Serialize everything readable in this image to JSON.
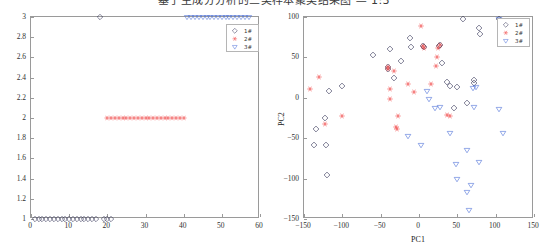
{
  "figure_title": "基于主成分分析的三类样本聚类结果图 — 1:3",
  "colors": {
    "class1": "#2b2b4f",
    "class2": "#f04a4a",
    "class3": "#4a6fd8",
    "axis": "#9a9a9a",
    "text": "#303030"
  },
  "legend": {
    "entries": [
      {
        "label": "1#",
        "marker": "diamond",
        "color": "#2b2b4f"
      },
      {
        "label": "2#",
        "marker": "asterisk",
        "color": "#f04a4a"
      },
      {
        "label": "3#",
        "marker": "triangle-down",
        "color": "#4a6fd8"
      }
    ]
  },
  "chart_data": [
    {
      "id": "cluster-assignment-plot",
      "type": "scatter",
      "title": "",
      "xlabel": "",
      "ylabel": "",
      "xlim": [
        0,
        60
      ],
      "ylim": [
        1,
        3
      ],
      "xticks": [
        0,
        10,
        20,
        30,
        40,
        50,
        60
      ],
      "yticks": [
        1,
        1.2,
        1.4,
        1.6,
        1.8,
        2,
        2.2,
        2.4,
        2.6,
        2.8,
        3
      ],
      "xticklabels": [
        "0",
        "10",
        "20",
        "30",
        "40",
        "50",
        "60"
      ],
      "yticklabels": [
        "1",
        "1.2",
        "1.4",
        "1.6",
        "1.8",
        "2",
        "2.2",
        "2.4",
        "2.6",
        "2.8",
        "3"
      ],
      "grid": false,
      "legend_position": "top-right-inside",
      "series": [
        {
          "name": "1#",
          "marker": "diamond",
          "color": "#2b2b4f",
          "points": [
            [
              1,
              1
            ],
            [
              2,
              1
            ],
            [
              3,
              1
            ],
            [
              4,
              1
            ],
            [
              5,
              1
            ],
            [
              6,
              1
            ],
            [
              7,
              1
            ],
            [
              8,
              1
            ],
            [
              9,
              1
            ],
            [
              10,
              1
            ],
            [
              11,
              1
            ],
            [
              12,
              1
            ],
            [
              13,
              1
            ],
            [
              14,
              1
            ],
            [
              15,
              1
            ],
            [
              16,
              1
            ],
            [
              17,
              1
            ],
            [
              19,
              1
            ],
            [
              20,
              1
            ],
            [
              21,
              1
            ],
            [
              18,
              3
            ]
          ]
        },
        {
          "name": "2#",
          "marker": "asterisk",
          "color": "#f04a4a",
          "points": [
            [
              20,
              2
            ],
            [
              21,
              2
            ],
            [
              22,
              2
            ],
            [
              23,
              2
            ],
            [
              24,
              2
            ],
            [
              25,
              2
            ],
            [
              26,
              2
            ],
            [
              27,
              2
            ],
            [
              28,
              2
            ],
            [
              29,
              2
            ],
            [
              30,
              2
            ],
            [
              31,
              2
            ],
            [
              32,
              2
            ],
            [
              33,
              2
            ],
            [
              34,
              2
            ],
            [
              35,
              2
            ],
            [
              36,
              2
            ],
            [
              37,
              2
            ],
            [
              38,
              2
            ],
            [
              39,
              2
            ],
            [
              40,
              2
            ]
          ]
        },
        {
          "name": "3#",
          "marker": "triangle-down",
          "color": "#4a6fd8",
          "points": [
            [
              41,
              3
            ],
            [
              42,
              3
            ],
            [
              43,
              3
            ],
            [
              44,
              3
            ],
            [
              45,
              3
            ],
            [
              46,
              3
            ],
            [
              47,
              3
            ],
            [
              48,
              3
            ],
            [
              49,
              3
            ],
            [
              50,
              3
            ],
            [
              51,
              3
            ],
            [
              52,
              3
            ],
            [
              53,
              3
            ],
            [
              54,
              3
            ],
            [
              55,
              3
            ],
            [
              56,
              3
            ],
            [
              57,
              3
            ]
          ]
        }
      ]
    },
    {
      "id": "pca-score-plot",
      "type": "scatter",
      "title": "",
      "xlabel": "PC1",
      "ylabel": "PC2",
      "xlim": [
        -150,
        150
      ],
      "ylim": [
        -150,
        100
      ],
      "xticks": [
        -150,
        -100,
        -50,
        0,
        50,
        100,
        150
      ],
      "yticks": [
        -150,
        -100,
        -50,
        0,
        50,
        100
      ],
      "xticklabels": [
        "−150",
        "−100",
        "−50",
        "0",
        "50",
        "100",
        "150"
      ],
      "yticklabels": [
        "−150",
        "−100",
        "−50",
        "0",
        "50",
        "100"
      ],
      "grid": false,
      "legend_position": "top-right-inside",
      "series": [
        {
          "name": "1#",
          "marker": "diamond",
          "color": "#2b2b4f",
          "points": [
            [
              -118,
              8
            ],
            [
              -101,
              14
            ],
            [
              -60,
              53
            ],
            [
              -38,
              60
            ],
            [
              -41,
              38
            ],
            [
              -40,
              36
            ],
            [
              -24,
              46
            ],
            [
              -32,
              24
            ],
            [
              -12,
              74
            ],
            [
              -11,
              63
            ],
            [
              5,
              64
            ],
            [
              7,
              63
            ],
            [
              26,
              64
            ],
            [
              28,
              65
            ],
            [
              30,
              43
            ],
            [
              37,
              19
            ],
            [
              41,
              15
            ],
            [
              50,
              13
            ],
            [
              58,
              97
            ],
            [
              72,
              22
            ],
            [
              72,
              18
            ],
            [
              78,
              86
            ],
            [
              80,
              79
            ],
            [
              104,
              97
            ],
            [
              -134,
              -38
            ],
            [
              -137,
              -59
            ],
            [
              -122,
              -25
            ],
            [
              -121,
              -58
            ],
            [
              -120,
              -96
            ],
            [
              46,
              -13
            ],
            [
              62,
              -6
            ]
          ]
        },
        {
          "name": "2#",
          "marker": "asterisk",
          "color": "#f04a4a",
          "points": [
            [
              -142,
              11
            ],
            [
              -131,
              26
            ],
            [
              -123,
              -32
            ],
            [
              -100,
              -22
            ],
            [
              -41,
              38
            ],
            [
              -40,
              36
            ],
            [
              -38,
              11
            ],
            [
              -38,
              -2
            ],
            [
              -33,
              33
            ],
            [
              -30,
              -36
            ],
            [
              -29,
              -38
            ],
            [
              -28,
              -22
            ],
            [
              -14,
              17
            ],
            [
              -6,
              7
            ],
            [
              3,
              89
            ],
            [
              5,
              64
            ],
            [
              6,
              62
            ],
            [
              16,
              17
            ],
            [
              22,
              39
            ],
            [
              24,
              50
            ],
            [
              25,
              62
            ],
            [
              28,
              65
            ],
            [
              37,
              -21
            ],
            [
              40,
              -22
            ]
          ]
        },
        {
          "name": "3#",
          "marker": "triangle-down",
          "color": "#4a6fd8",
          "points": [
            [
              11,
              9
            ],
            [
              13,
              -1
            ],
            [
              21,
              -13
            ],
            [
              27,
              -11
            ],
            [
              -14,
              -47
            ],
            [
              3,
              -58
            ],
            [
              40,
              -43
            ],
            [
              48,
              -82
            ],
            [
              50,
              -100
            ],
            [
              62,
              -64
            ],
            [
              63,
              -117
            ],
            [
              65,
              -139
            ],
            [
              68,
              -108
            ],
            [
              72,
              -11
            ],
            [
              78,
              -79
            ],
            [
              70,
              12
            ],
            [
              74,
              13
            ],
            [
              104,
              -14
            ],
            [
              110,
              -44
            ],
            [
              104,
              97
            ]
          ]
        }
      ]
    }
  ]
}
